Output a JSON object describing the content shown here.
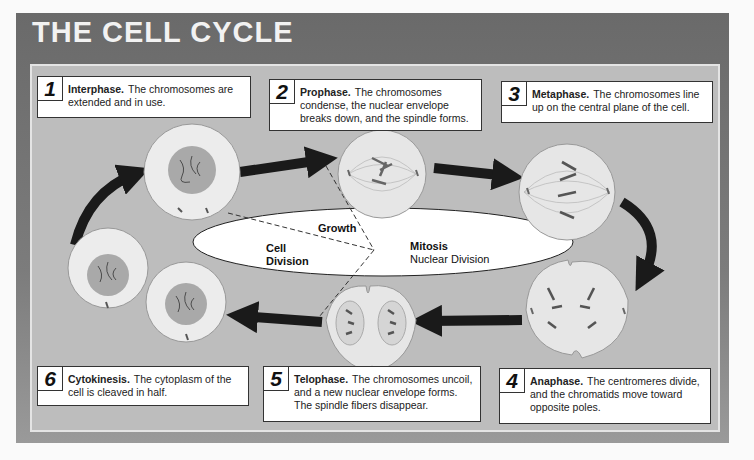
{
  "title": "THE CELL CYCLE",
  "stages": [
    {
      "number": "1",
      "name": "Interphase.",
      "description": "The chromosomes are extended and in use."
    },
    {
      "number": "2",
      "name": "Prophase.",
      "description": "The chromosomes condense, the nuclear envelope breaks down, and the spindle forms."
    },
    {
      "number": "3",
      "name": "Metaphase.",
      "description": "The chromosomes line up on the central plane of the cell."
    },
    {
      "number": "4",
      "name": "Anaphase.",
      "description": "The centromeres divide, and the chromatids move toward opposite poles."
    },
    {
      "number": "5",
      "name": "Telophase.",
      "description": "The chromosomes uncoil, and a new nuclear envelope forms. The spindle fibers disappear."
    },
    {
      "number": "6",
      "name": "Cytokinesis.",
      "description": "The cytoplasm of the cell is cleaved in half."
    }
  ],
  "center": {
    "growth": "Growth",
    "cell_division_line1": "Cell",
    "cell_division_line2": "Division",
    "mitosis": "Mitosis",
    "nuclear_division": "Nuclear Division"
  },
  "colors": {
    "header": "#6e6e6e",
    "panel": "#bdbdbd",
    "cell": "#ececec",
    "nucleus": "#a9a9a9",
    "arrow": "#1a1a1a"
  }
}
